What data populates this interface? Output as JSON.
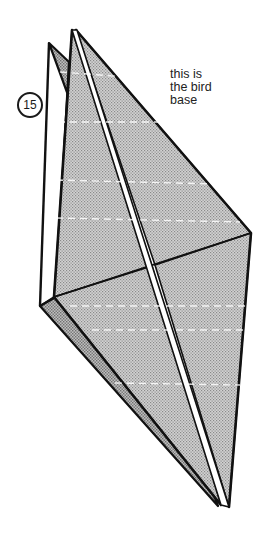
{
  "step": {
    "number": "15"
  },
  "caption": {
    "lines": [
      "this is",
      "the bird",
      "base"
    ]
  },
  "figure": {
    "colors": {
      "paper_fill": "#c4c4c4",
      "paper_fill_back": "#b2b2b2",
      "outline": "#111111",
      "crease_highlight": "#ffffff",
      "background": "#ffffff"
    }
  }
}
